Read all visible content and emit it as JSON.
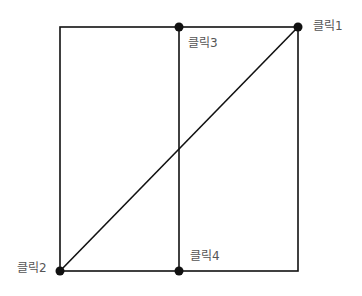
{
  "diagram": {
    "line_color": "#111111",
    "point_color": "#111111",
    "rectangle": {
      "left": 60,
      "top": 27,
      "right": 298,
      "bottom": 271
    },
    "divider_x": 179,
    "points": [
      {
        "id": "p1",
        "label": "클릭1",
        "x": 298,
        "y": 27
      },
      {
        "id": "p2",
        "label": "클릭2",
        "x": 60,
        "y": 271
      },
      {
        "id": "p3",
        "label": "클릭3",
        "x": 179,
        "y": 27
      },
      {
        "id": "p4",
        "label": "클릭4",
        "x": 179,
        "y": 271
      }
    ],
    "labels": {
      "p1": "클릭1",
      "p2": "클릭2",
      "p3": "클릭3",
      "p4": "클릭4"
    }
  }
}
